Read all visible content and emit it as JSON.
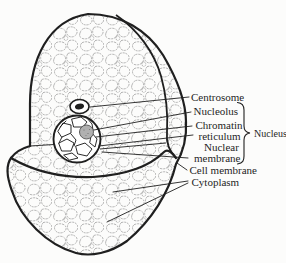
{
  "figure": {
    "kind": "cell-structure-diagram",
    "labels": {
      "centrosome": "Centrosome",
      "nucleolus": "Nucleolus",
      "chromatin_line1": "Chromatin",
      "chromatin_line2": "reticulum",
      "nucleus": "Nucleus",
      "nuclear_membrane_line1": "Nuclear",
      "nuclear_membrane_line2": "membrane",
      "cell_membrane": "Cell membrane",
      "cytoplasm": "Cytoplasm"
    },
    "colors": {
      "ink": "#1f1f1f",
      "texture": "#8e8e8e",
      "nucleolus_fill": "#b0b0b0",
      "background": "#fcfcfb"
    }
  }
}
